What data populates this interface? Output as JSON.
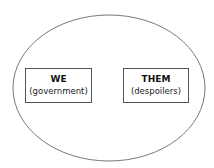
{
  "diagram": {
    "left_box": {
      "title": "WE",
      "subtitle": "(government)"
    },
    "right_box": {
      "title": "THEM",
      "subtitle": "(despoilers)"
    },
    "colors": {
      "stroke": "#555555",
      "background": "#ffffff"
    }
  }
}
